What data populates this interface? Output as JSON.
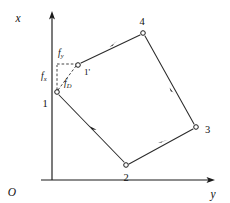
{
  "figure": {
    "background_color": "#ffffff",
    "line_color": "#1a1a1a"
  },
  "axes": {
    "vertical": {
      "label": "x",
      "arrow": "up-arrow-icon",
      "origin_pixel": [
        52,
        180
      ],
      "end_pixel": [
        52,
        14
      ]
    },
    "horizontal": {
      "label": "y",
      "arrow": "right-arrow-icon",
      "origin_pixel": [
        52,
        180
      ],
      "end_pixel": [
        214,
        180
      ]
    },
    "origin": {
      "label": "O"
    }
  },
  "nodes": [
    {
      "id": "n1",
      "label": "1",
      "x": 57,
      "y": 92,
      "label_x": 45,
      "label_y": 106
    },
    {
      "id": "n1prime",
      "label": "1'",
      "x": 78,
      "y": 65,
      "label_x": 83,
      "label_y": 74
    },
    {
      "id": "n2",
      "label": "2",
      "x": 126,
      "y": 165,
      "label_x": 122,
      "label_y": 180
    },
    {
      "id": "n3",
      "label": "3",
      "x": 196,
      "y": 127,
      "label_x": 203,
      "label_y": 133
    },
    {
      "id": "n4",
      "label": "4",
      "x": 143,
      "y": 33,
      "label_x": 139,
      "label_y": 24
    }
  ],
  "edges": [
    {
      "id": "e-1p-4",
      "from": "n1prime",
      "to": "n4",
      "arrow": "forward"
    },
    {
      "id": "e-4-3",
      "from": "n4",
      "to": "n3",
      "arrow": "forward"
    },
    {
      "id": "e-1-2",
      "from": "n1",
      "to": "n2",
      "arrow": "forward"
    },
    {
      "id": "e-2-3",
      "from": "n2",
      "to": "n3",
      "arrow": "forward"
    }
  ],
  "components": {
    "vertical_leg": {
      "symbol": "f",
      "subscript": "x",
      "label_x": 44,
      "label_y": 79
    },
    "horizontal_leg": {
      "symbol": "f",
      "subscript": "y",
      "label_x": 58,
      "label_y": 56
    },
    "diagonal": {
      "symbol": "f",
      "subscript": "D",
      "label_x": 66,
      "label_y": 85
    }
  }
}
